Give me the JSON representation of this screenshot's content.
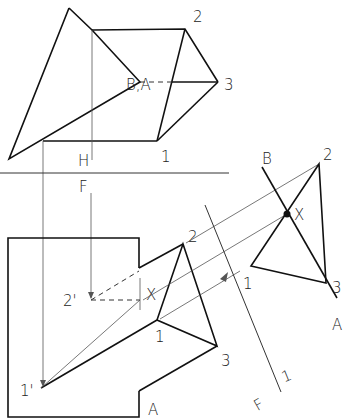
{
  "figure": {
    "type": "descriptive-geometry-drawing",
    "fold_lines": {
      "hf": {
        "upper": "H",
        "lower": "F"
      },
      "f1": {
        "left": "F",
        "right": "1"
      }
    },
    "top_view": {
      "labels": {
        "apex": "B,A",
        "p1": "1",
        "p2": "2",
        "p3": "3"
      }
    },
    "front_view": {
      "labels": {
        "p1": "1",
        "p2": "2",
        "p3": "3",
        "p1p": "1'",
        "p2p": "2'",
        "x": "X",
        "plane": "A"
      }
    },
    "aux_view": {
      "labels": {
        "p1": "1",
        "p2": "2",
        "p3": "3",
        "x": "X",
        "b": "B",
        "a": "A"
      }
    }
  }
}
